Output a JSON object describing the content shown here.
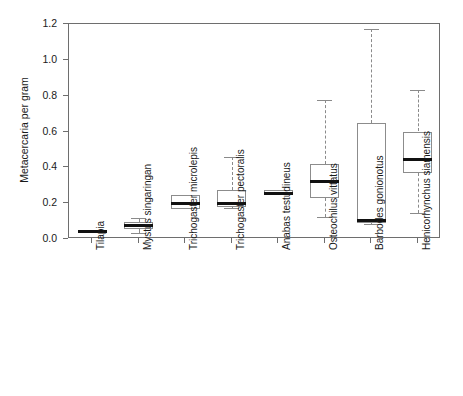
{
  "chart_data": {
    "type": "bar",
    "plot_kind": "boxplot",
    "title": "",
    "xlabel": "",
    "ylabel": "Metacercaria per gram",
    "ylim": [
      0.0,
      1.2
    ],
    "yticks": [
      "0.0",
      "0.2",
      "0.4",
      "0.6",
      "0.8",
      "1.0",
      "1.2"
    ],
    "ytick_values": [
      0.0,
      0.2,
      0.4,
      0.6,
      0.8,
      1.0,
      1.2
    ],
    "grid": false,
    "legend": "none",
    "categories": [
      "Tilapia",
      "Mystus singaringan",
      "Trichogaster microlepis",
      "Trichogaster pectoralis",
      "Anabas testudineus",
      "Osteochilus vittatus",
      "Barbodes gonionotus",
      "Henicorhynchus siamensis"
    ],
    "boxes": [
      {
        "name": "Tilapia",
        "lower_whisker": 0.035,
        "q1": 0.035,
        "median": 0.04,
        "q3": 0.042,
        "upper_whisker": 0.042
      },
      {
        "name": "Mystus singaringan",
        "lower_whisker": 0.035,
        "q1": 0.055,
        "median": 0.075,
        "q3": 0.095,
        "upper_whisker": 0.115
      },
      {
        "name": "Trichogaster microlepis",
        "lower_whisker": 0.17,
        "q1": 0.17,
        "median": 0.2,
        "q3": 0.245,
        "upper_whisker": 0.245
      },
      {
        "name": "Trichogaster pectoralis",
        "lower_whisker": 0.175,
        "q1": 0.18,
        "median": 0.2,
        "q3": 0.275,
        "upper_whisker": 0.46
      },
      {
        "name": "Anabas testudineus",
        "lower_whisker": 0.245,
        "q1": 0.245,
        "median": 0.255,
        "q3": 0.275,
        "upper_whisker": 0.275
      },
      {
        "name": "Osteochilus vittatus",
        "lower_whisker": 0.125,
        "q1": 0.23,
        "median": 0.32,
        "q3": 0.42,
        "upper_whisker": 0.775
      },
      {
        "name": "Barbodes gonionotus",
        "lower_whisker": 0.085,
        "q1": 0.09,
        "median": 0.105,
        "q3": 0.645,
        "upper_whisker": 1.17
      },
      {
        "name": "Henicorhynchus siamensis",
        "lower_whisker": 0.145,
        "q1": 0.37,
        "median": 0.445,
        "q3": 0.6,
        "upper_whisker": 0.83
      }
    ],
    "colors": {
      "box_outline": "#8c8c8c",
      "median": "#111111",
      "whisker": "#8a8a8a",
      "axis": "#6e6e6e",
      "background": "#ffffff"
    }
  }
}
